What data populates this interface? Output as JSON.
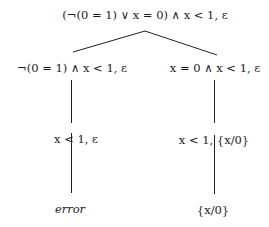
{
  "diagram": {
    "type": "derivation-tree",
    "nodes": {
      "root": {
        "label": "(¬(0 = 1) ∨ x = 0) ∧ x < 1, ε"
      },
      "left": {
        "label": "¬(0 = 1) ∧ x < 1, ε"
      },
      "right": {
        "label": "x = 0 ∧ x < 1, ε"
      },
      "left_child": {
        "label": "x < 1, ε"
      },
      "right_child": {
        "label": "x < 1, {x/0}"
      },
      "left_leaf": {
        "label": "error"
      },
      "right_leaf": {
        "label": "{x/0}"
      }
    },
    "edges": [
      [
        "root",
        "left"
      ],
      [
        "root",
        "right"
      ],
      [
        "left",
        "left_child"
      ],
      [
        "right",
        "right_child"
      ],
      [
        "left_child",
        "left_leaf"
      ],
      [
        "right_child",
        "right_leaf"
      ]
    ]
  }
}
